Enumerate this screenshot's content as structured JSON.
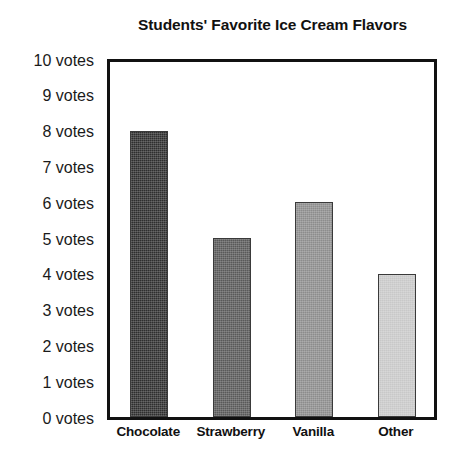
{
  "chart_data": {
    "type": "bar",
    "title": "Students' Favorite Ice Cream Flavors",
    "xlabel": "",
    "ylabel": "",
    "categories": [
      "Chocolate",
      "Strawberry",
      "Vanilla",
      "Other"
    ],
    "values": [
      8,
      5,
      6,
      4
    ],
    "ylim": [
      0,
      10
    ],
    "ytick_values": [
      0,
      1,
      2,
      3,
      4,
      5,
      6,
      7,
      8,
      9,
      10
    ],
    "ytick_labels": [
      "0 votes",
      "1 votes",
      "2 votes",
      "3 votes",
      "4 votes",
      "5 votes",
      "6 votes",
      "7 votes",
      "8 votes",
      "9 votes",
      "10 votes"
    ],
    "unit": "votes",
    "grid": false,
    "legend": false,
    "legend_position": "none",
    "bar_colors": [
      "#2e2e2e",
      "#595959",
      "#8c8c8c",
      "#c8c8c8"
    ],
    "axis_color": "#111111",
    "background_color": "#ffffff"
  }
}
